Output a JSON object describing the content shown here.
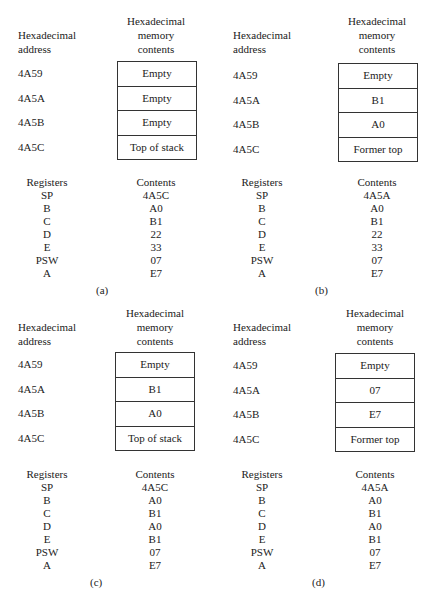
{
  "headers": {
    "address": [
      "Hexadecimal",
      "address"
    ],
    "memory": [
      "Hexadecimal",
      "memory",
      "contents"
    ],
    "registers": "Registers",
    "contents": "Contents"
  },
  "panels": [
    {
      "caption": "(a)",
      "addresses": [
        "4A59",
        "4A5A",
        "4A5B",
        "4A5C"
      ],
      "memory": [
        "Empty",
        "Empty",
        "Empty",
        "Top of stack"
      ],
      "registers": [
        "SP",
        "B",
        "C",
        "D",
        "E",
        "PSW",
        "A"
      ],
      "contents": [
        "4A5C",
        "A0",
        "B1",
        "22",
        "33",
        "07",
        "E7"
      ]
    },
    {
      "caption": "(b)",
      "addresses": [
        "4A59",
        "4A5A",
        "4A5B",
        "4A5C"
      ],
      "memory": [
        "Empty",
        "B1",
        "A0",
        "Former top"
      ],
      "registers": [
        "SP",
        "B",
        "C",
        "D",
        "E",
        "PSW",
        "A"
      ],
      "contents": [
        "4A5A",
        "A0",
        "B1",
        "22",
        "33",
        "07",
        "E7"
      ]
    },
    {
      "caption": "(c)",
      "addresses": [
        "4A59",
        "4A5A",
        "4A5B",
        "4A5C"
      ],
      "memory": [
        "Empty",
        "B1",
        "A0",
        "Top of stack"
      ],
      "registers": [
        "SP",
        "B",
        "C",
        "D",
        "E",
        "PSW",
        "A"
      ],
      "contents": [
        "4A5C",
        "A0",
        "B1",
        "A0",
        "B1",
        "07",
        "E7"
      ]
    },
    {
      "caption": "(d)",
      "addresses": [
        "4A59",
        "4A5A",
        "4A5B",
        "4A5C"
      ],
      "memory": [
        "Empty",
        "07",
        "E7",
        "Former top"
      ],
      "registers": [
        "SP",
        "B",
        "C",
        "D",
        "E",
        "PSW",
        "A"
      ],
      "contents": [
        "4A5A",
        "A0",
        "B1",
        "A0",
        "B1",
        "07",
        "E7"
      ]
    }
  ]
}
